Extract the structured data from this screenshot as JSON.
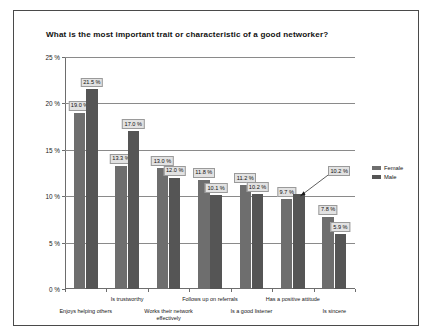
{
  "chart_data": {
    "type": "bar",
    "title": "What is the most important trait or characteristic of a good networker?",
    "xlabel": "",
    "ylabel": "",
    "ylim": [
      0,
      25
    ],
    "ytick_values": [
      0,
      5,
      10,
      15,
      20,
      25
    ],
    "ytick_labels": [
      "0 %",
      "5 %",
      "10 %",
      "15 %",
      "20 %",
      "25 %"
    ],
    "grid": true,
    "legend_position": "right",
    "categories": [
      "Enjoys helping others",
      "Is trustworthy",
      "Works their network\neffectively",
      "Follows up on referrals",
      "Is a good listener",
      "Has a positive attitude",
      "Is sincere"
    ],
    "series": [
      {
        "name": "Female",
        "color": "#6e6e6e",
        "values": [
          19.0,
          13.3,
          13.0,
          11.8,
          11.2,
          9.7,
          7.8
        ],
        "labels": [
          "19.0 %",
          "13.3 %",
          "13.0 %",
          "11.8 %",
          "11.2 %",
          "9.7 %",
          "7.8 %"
        ]
      },
      {
        "name": "Male",
        "color": "#555555",
        "values": [
          21.5,
          17.0,
          12.0,
          10.1,
          10.2,
          10.2,
          5.9
        ],
        "labels": [
          "21.5 %",
          "17.0 %",
          "12.0 %",
          "10.1 %",
          "10.2 %",
          "10.2 %",
          "5.9 %"
        ]
      }
    ],
    "annotations": [
      {
        "text": "10.2 %",
        "points_to_series": "Male",
        "points_to_category": "Has a positive attitude",
        "style": "leader-line"
      }
    ]
  }
}
